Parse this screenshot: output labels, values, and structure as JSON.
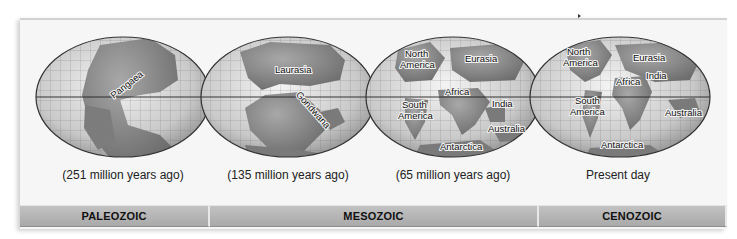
{
  "figure": {
    "globes": [
      {
        "id": "paleozoic-251",
        "caption": "(251 million years ago)",
        "labels": [
          "Pangaea"
        ]
      },
      {
        "id": "mesozoic-135",
        "caption": "(135 million years ago)",
        "labels": [
          "Laurasia",
          "Gondwana"
        ]
      },
      {
        "id": "mesozoic-65",
        "caption": "(65 million years ago)",
        "labels": [
          "North",
          "America",
          "Eurasia",
          "Africa",
          "South",
          "America",
          "India",
          "Australia",
          "Antarctica"
        ]
      },
      {
        "id": "present",
        "caption": "Present day",
        "labels": [
          "North",
          "America",
          "Eurasia",
          "India",
          "Africa",
          "South",
          "America",
          "Australia",
          "Antarctica"
        ]
      }
    ],
    "eras": [
      {
        "label": "PALEOZOIC"
      },
      {
        "label": "MESOZOIC"
      },
      {
        "label": "CENOZOIC"
      }
    ],
    "colors": {
      "ocean": "#d8d8d8",
      "land": "#8a8a8a",
      "grid": "#555555",
      "era_bar": "#b5b5b5",
      "panel": "#f6f6f6"
    }
  }
}
